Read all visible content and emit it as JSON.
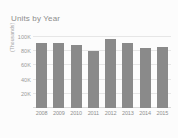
{
  "chart_data": {
    "type": "bar",
    "title": "Units by Year",
    "xlabel": "",
    "ylabel": "(Thousands)",
    "categories": [
      "2008",
      "2009",
      "2010",
      "2011",
      "2012",
      "2013",
      "2014",
      "2015"
    ],
    "values": [
      91,
      92,
      89,
      81,
      98,
      92,
      85,
      86
    ],
    "series": [
      {
        "name": "Units",
        "values": [
          91,
          92,
          89,
          81,
          98,
          92,
          85,
          86
        ]
      }
    ],
    "ylim": [
      0,
      110
    ],
    "y_ticks": [
      20,
      40,
      60,
      80,
      100
    ],
    "y_tick_labels": [
      "20K",
      "40K",
      "60K",
      "80K",
      "100K"
    ],
    "grid": true,
    "legend": "none",
    "colors": {
      "bar": "#8a8a8a",
      "gridline": "#e6e6e6",
      "title_text": "#8d8d8d",
      "tick_text": "#9a9a9a",
      "background": "#fcfcfc"
    }
  }
}
